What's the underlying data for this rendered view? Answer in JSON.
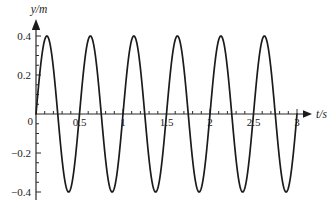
{
  "page": {
    "background": "#ffffff",
    "text_color": "#222222"
  },
  "chart_data": {
    "type": "line",
    "title": "",
    "xlabel": "t/s",
    "ylabel": "y/m",
    "x_range": [
      0,
      3
    ],
    "y_range": [
      -0.4,
      0.4
    ],
    "grid": false,
    "legend": "none",
    "origin_label": "0",
    "x_ticks": [
      {
        "value": 0.5,
        "label": "0.5"
      },
      {
        "value": 1,
        "label": "1"
      },
      {
        "value": 1.5,
        "label": "1.5"
      },
      {
        "value": 2,
        "label": "2"
      },
      {
        "value": 2.5,
        "label": "2.5"
      },
      {
        "value": 3,
        "label": "3"
      }
    ],
    "y_ticks": [
      {
        "value": 0.4,
        "label": "0.4"
      },
      {
        "value": 0.2,
        "label": "0.2"
      },
      {
        "value": -0.2,
        "label": "−0.2"
      },
      {
        "value": -0.4,
        "label": "−0.4"
      }
    ],
    "x_minor_step": 0.1,
    "y_minor_step": 0.05,
    "line_color": "#1b1b1b",
    "wave": {
      "form": "sine",
      "amplitude": 0.4,
      "period": 0.5,
      "phase_deg": 0,
      "cycles_shown": 6
    },
    "series": [
      {
        "name": "displacement",
        "points": [
          [
            0,
            0
          ],
          [
            0.125,
            0.4
          ],
          [
            0.25,
            0
          ],
          [
            0.375,
            -0.4
          ],
          [
            0.5,
            0
          ],
          [
            0.625,
            0.4
          ],
          [
            0.75,
            0
          ],
          [
            0.875,
            -0.4
          ],
          [
            1,
            0
          ],
          [
            1.125,
            0.4
          ],
          [
            1.25,
            0
          ],
          [
            1.375,
            -0.4
          ],
          [
            1.5,
            0
          ],
          [
            1.625,
            0.4
          ],
          [
            1.75,
            0
          ],
          [
            1.875,
            -0.4
          ],
          [
            2,
            0
          ],
          [
            2.125,
            0.4
          ],
          [
            2.25,
            0
          ],
          [
            2.375,
            -0.4
          ],
          [
            2.5,
            0
          ],
          [
            2.625,
            0.4
          ],
          [
            2.75,
            0
          ],
          [
            2.875,
            -0.4
          ],
          [
            3,
            0
          ]
        ]
      }
    ]
  }
}
